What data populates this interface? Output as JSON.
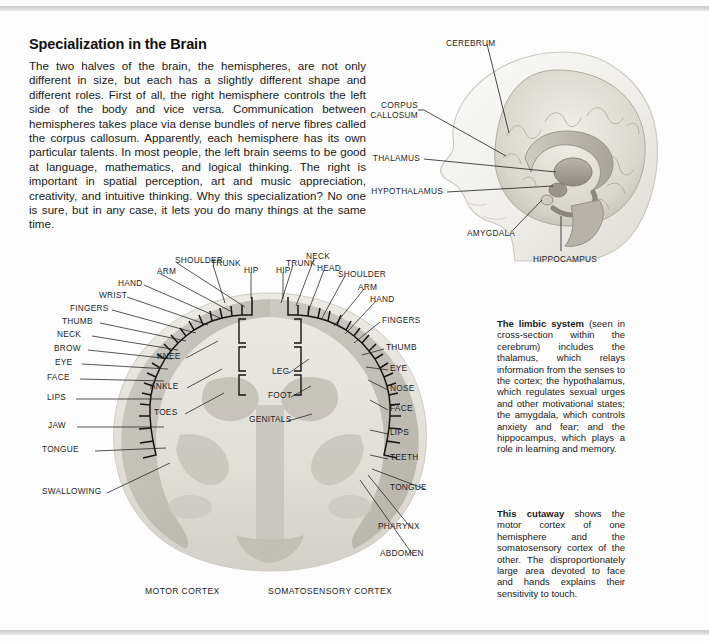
{
  "article": {
    "title": "Specialization in the Brain",
    "body": "The two halves of the brain, the hemispheres, are not only different in size, but each has a slightly different shape and different roles. First of all, the right hemisphere controls the left side of the body and vice versa. Communication between hemispheres takes place via dense bundles of nerve fibres called the corpus callosum. Apparently, each hemisphere has its own particular talents. In most people, the left brain seems to be good at language, mathematics, and logical thinking. The right is important in spatial perception, art and music appreciation, creativity, and intuitive thinking. Why this specialization? No one is sure, but in any case, it lets you do many things at the same time."
  },
  "head_diagram": {
    "labels": [
      {
        "id": "cerebrum",
        "text": "CEREBRUM"
      },
      {
        "id": "corpus-callosum-line1",
        "text": "CORPUS"
      },
      {
        "id": "corpus-callosum-line2",
        "text": "CALLOSUM"
      },
      {
        "id": "thalamus",
        "text": "THALAMUS"
      },
      {
        "id": "hypothalamus",
        "text": "HYPOTHALAMUS"
      },
      {
        "id": "amygdala",
        "text": "AMYGDALA"
      },
      {
        "id": "hippocampus",
        "text": "HIPPOCAMPUS"
      }
    ]
  },
  "cortex_diagram": {
    "motor_caption": "MOTOR CORTEX",
    "somatosensory_caption": "SOMATOSENSORY CORTEX",
    "left_outer": [
      {
        "id": "shoulder",
        "text": "SHOULDER"
      },
      {
        "id": "arm",
        "text": "ARM"
      },
      {
        "id": "trunk",
        "text": "TRUNK"
      },
      {
        "id": "hip",
        "text": "HIP"
      },
      {
        "id": "hand",
        "text": "HAND"
      },
      {
        "id": "wrist",
        "text": "WRIST"
      },
      {
        "id": "fingers",
        "text": "FINGERS"
      },
      {
        "id": "thumb",
        "text": "THUMB"
      },
      {
        "id": "neck",
        "text": "NECK"
      },
      {
        "id": "brow",
        "text": "BROW"
      },
      {
        "id": "eye",
        "text": "EYE"
      },
      {
        "id": "face",
        "text": "FACE"
      },
      {
        "id": "lips",
        "text": "LIPS"
      },
      {
        "id": "jaw",
        "text": "JAW"
      },
      {
        "id": "tongue",
        "text": "TONGUE"
      },
      {
        "id": "swallowing",
        "text": "SWALLOWING"
      }
    ],
    "left_inner": [
      {
        "id": "knee",
        "text": "KNEE"
      },
      {
        "id": "ankle",
        "text": "ANKLE"
      },
      {
        "id": "toes",
        "text": "TOES"
      }
    ],
    "right_outer": [
      {
        "id": "hip-r",
        "text": "HIP"
      },
      {
        "id": "trunk-r",
        "text": "TRUNK"
      },
      {
        "id": "neck-r",
        "text": "NECK"
      },
      {
        "id": "head-r",
        "text": "HEAD"
      },
      {
        "id": "shoulder-r",
        "text": "SHOULDER"
      },
      {
        "id": "arm-r",
        "text": "ARM"
      },
      {
        "id": "hand-r",
        "text": "HAND"
      },
      {
        "id": "fingers-r",
        "text": "FINGERS"
      },
      {
        "id": "thumb-r",
        "text": "THUMB"
      },
      {
        "id": "eye-r",
        "text": "EYE"
      },
      {
        "id": "nose-r",
        "text": "NOSE"
      },
      {
        "id": "face-r",
        "text": "FACE"
      },
      {
        "id": "lips-r",
        "text": "LIPS"
      },
      {
        "id": "teeth-r",
        "text": "TEETH"
      },
      {
        "id": "tongue-r",
        "text": "TONGUE"
      },
      {
        "id": "pharynx-r",
        "text": "PHARYNX"
      },
      {
        "id": "abdomen-r",
        "text": "ABDOMEN"
      }
    ],
    "right_inner": [
      {
        "id": "leg",
        "text": "LEG"
      },
      {
        "id": "foot",
        "text": "FOOT"
      },
      {
        "id": "genitals",
        "text": "GENITALS"
      }
    ]
  },
  "captions": {
    "limbic_lead": "The limbic system",
    "limbic_body": " (seen in cross-section within the cerebrum) includes the thalamus, which relays information from the senses to the cortex; the hypothalamus, which regulates sexual urges and other motivational states; the amygdala, which controls anxiety and fear; and the hippocampus, which plays a role in learning and memory.",
    "cutaway_lead": "This cutaway",
    "cutaway_body": " shows the motor cortex of one hemisphere and the somatosensory cortex of the other. The disproportionately large area devoted to face and hands explains their sensitivity to touch."
  },
  "colors": {
    "page_background": "#fdfdfd",
    "rule": "#c9c9c9",
    "text": "#1a1a1a",
    "brain_light": "#e6e4df",
    "brain_mid": "#cdcac3",
    "brain_dark": "#b3afa7",
    "outline": "#1d1d1d"
  }
}
